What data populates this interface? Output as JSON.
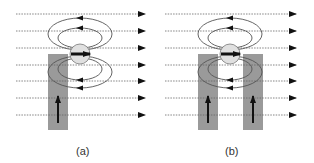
{
  "panels": [
    {
      "id": "a",
      "caption": "(a)",
      "offset_x": 0,
      "columns": [
        {
          "x": 48,
          "y": 54,
          "w": 20,
          "h": 76
        }
      ]
    },
    {
      "id": "b",
      "caption": "(b)",
      "offset_x": 155,
      "columns": [
        {
          "x": 198,
          "y": 54,
          "w": 20,
          "h": 76
        },
        {
          "x": 243,
          "y": 54,
          "w": 20,
          "h": 76
        }
      ]
    }
  ],
  "field_lines_y": [
    14,
    31,
    48,
    65,
    81,
    98,
    115
  ],
  "colors": {
    "column_fill": "#9a9a9a",
    "field_line": "#666666",
    "loop_stroke": "#555555",
    "dipole_fill": "#e0e0e0",
    "arrow": "#111111"
  },
  "captions": {
    "a": "(a)",
    "b": "(b)"
  }
}
